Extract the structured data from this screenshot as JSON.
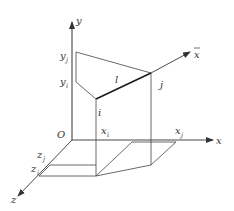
{
  "figure": {
    "line_color": "#333333",
    "thick_line_color": "#1a1a1a",
    "background": "#ffffff"
  },
  "axes": {
    "y": {
      "label": "y"
    },
    "x": {
      "label": "x"
    },
    "z": {
      "label": "z"
    },
    "local_x": {
      "label": "x",
      "bar": "‾"
    },
    "origin": {
      "label": "O"
    }
  },
  "points": {
    "i": {
      "label": "i"
    },
    "j": {
      "label": "j"
    }
  },
  "element": {
    "label": "l"
  },
  "coordinate_labels": {
    "y_j": {
      "base": "y",
      "sub": "j"
    },
    "y_i": {
      "base": "y",
      "sub": "i"
    },
    "x_i": {
      "base": "x",
      "sub": "i"
    },
    "x_j": {
      "base": "x",
      "sub": "j"
    },
    "z_j": {
      "base": "z",
      "sub": "j"
    },
    "z_i": {
      "base": "z",
      "sub": "i"
    }
  }
}
